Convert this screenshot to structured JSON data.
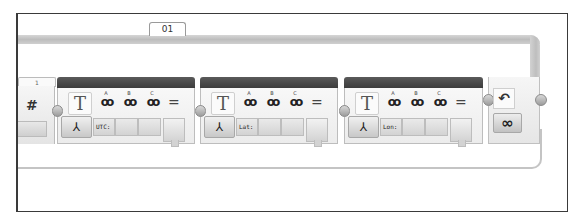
{
  "loop": {
    "tab_label": "01",
    "end_block": {
      "loop_icon": "loop-arrow-icon",
      "mode_label": "∞",
      "mode": "unlimited"
    }
  },
  "previous_block": {
    "tab_label": "1",
    "icon_label": "#"
  },
  "text_blocks": [
    {
      "icon_label": "T",
      "mode_icon": "merge-icon",
      "inputs": [
        "A",
        "B",
        "C"
      ],
      "values": [
        "UTC:",
        "",
        ""
      ],
      "equals": "="
    },
    {
      "icon_label": "T",
      "mode_icon": "merge-icon",
      "inputs": [
        "A",
        "B",
        "C"
      ],
      "values": [
        "Lat:",
        "",
        ""
      ],
      "equals": "="
    },
    {
      "icon_label": "T",
      "mode_icon": "merge-icon",
      "inputs": [
        "A",
        "B",
        "C"
      ],
      "values": [
        "Lon:",
        "",
        ""
      ],
      "equals": "="
    }
  ],
  "glyphs": {
    "link": "ꝏ",
    "merge": "⅄",
    "loop": "↶"
  }
}
